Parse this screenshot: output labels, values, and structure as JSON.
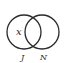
{
  "diagram": {
    "type": "venn",
    "sets": [
      {
        "name": "J",
        "label": "J"
      },
      {
        "name": "N",
        "label": "N"
      }
    ],
    "regions": {
      "j_only": "x"
    },
    "colors": {
      "stroke": "#2a2a2a",
      "background": "#ffffff"
    }
  }
}
